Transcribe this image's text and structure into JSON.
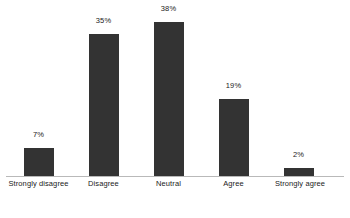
{
  "chart_data": {
    "type": "bar",
    "title": "",
    "subtitle": "",
    "xlabel": "",
    "ylabel": "",
    "categories": [
      "Strongly disagree",
      "Disagree",
      "Neutral",
      "Agree",
      "Strongly agree"
    ],
    "values": [
      7,
      35,
      38,
      19,
      2
    ],
    "value_labels": [
      "7%",
      "35%",
      "38%",
      "19%",
      "2%"
    ],
    "ylim": [
      0,
      38
    ],
    "grid": false,
    "legend": false,
    "legend_position": "none",
    "axis_line": true,
    "bar_color": "#333333",
    "axis_color": "#b9b9b9",
    "label_color": "#1a1a1a"
  }
}
